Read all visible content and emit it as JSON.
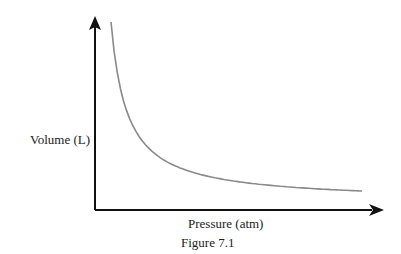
{
  "chart_data": {
    "type": "line",
    "title": "",
    "caption": "Figure 7.1",
    "xlabel": "Pressure (atm)",
    "ylabel": "Volume (L)",
    "grid": false,
    "legend": null,
    "ticks": "none",
    "series": [
      {
        "name": "V vs P",
        "color": "#8a8a8a",
        "x": [
          0.06,
          0.1,
          0.15,
          0.2,
          0.3,
          0.4,
          0.5,
          0.6,
          0.7,
          0.8,
          0.9,
          1.0
        ],
        "y": [
          1.0,
          0.62,
          0.43,
          0.33,
          0.23,
          0.18,
          0.15,
          0.13,
          0.12,
          0.115,
          0.11,
          0.108
        ]
      }
    ]
  },
  "labels": {
    "ylabel": "Volume (L)",
    "xlabel": "Pressure (atm)",
    "caption": "Figure 7.1"
  }
}
